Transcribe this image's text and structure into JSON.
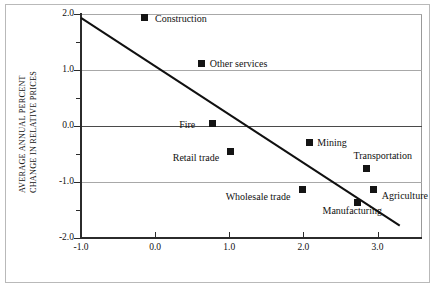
{
  "figure": {
    "frame": true,
    "background": "#ffffff",
    "marker_color": "#141414",
    "gridline_color": "#a8a8a8",
    "axis_color": "#2b2b2b"
  },
  "chart_data": {
    "type": "scatter",
    "title": "",
    "xlabel": "",
    "ylabel_line1": "AVERAGE ANNUAL PERCENT",
    "ylabel_line2": "CHANGE IN RELATIVE PRICES",
    "xlim": [
      -1.0,
      3.6
    ],
    "ylim": [
      -2.0,
      2.0
    ],
    "xticks": [
      -1.0,
      0.0,
      1.0,
      2.0,
      3.0
    ],
    "xticklabels": [
      "-1.0",
      "0.0",
      "1.0",
      "2.0",
      "3.0"
    ],
    "yticks": [
      -2.0,
      -1.5,
      -1.0,
      -0.5,
      0.0,
      0.5,
      1.0,
      1.5,
      2.0
    ],
    "yticklabels_major": [
      "2.0",
      "1.0",
      "0.0",
      "-1.0",
      "-2.0"
    ],
    "ymajor": [
      2.0,
      1.0,
      0.0,
      -1.0,
      -2.0
    ],
    "yminor": [
      1.5,
      0.5,
      -0.5,
      -1.5
    ],
    "grid": "horizontal",
    "legend": "none",
    "points": [
      {
        "label": "Construction",
        "x": -0.15,
        "y": 1.93,
        "label_dx": 11,
        "label_dy": -5
      },
      {
        "label": "Other services",
        "x": 0.63,
        "y": 1.12,
        "label_dx": 8,
        "label_dy": -5
      },
      {
        "label": "Fire",
        "x": 0.77,
        "y": 0.04,
        "label_dx": -33,
        "label_dy": -5
      },
      {
        "label": "Retail trade",
        "x": 1.02,
        "y": -0.45,
        "label_dx": -58,
        "label_dy": 1
      },
      {
        "label": "Mining",
        "x": 2.08,
        "y": -0.29,
        "label_dx": 8,
        "label_dy": -5
      },
      {
        "label": "Transportation",
        "x": 2.85,
        "y": -0.75,
        "label_dx": -13,
        "label_dy": -18
      },
      {
        "label": "Wholesale trade",
        "x": 1.99,
        "y": -1.13,
        "label_dx": -77,
        "label_dy": 2
      },
      {
        "label": "Agriculture",
        "x": 2.95,
        "y": -1.13,
        "label_dx": 8,
        "label_dy": 1
      },
      {
        "label": "Manufacturing",
        "x": 2.73,
        "y": -1.36,
        "label_dx": -35,
        "label_dy": 3
      }
    ],
    "trendline": {
      "x_start": -1.0,
      "y_start": 1.93,
      "x_end": 3.3,
      "y_end": -1.78,
      "slope": -0.86,
      "intercept": 1.07,
      "color": "#101010",
      "width": 2.0
    }
  }
}
